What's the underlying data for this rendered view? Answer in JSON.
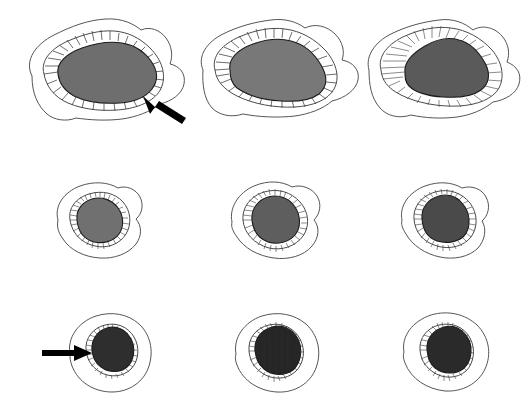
{
  "figure": {
    "title": "Oocyte and follicle development series",
    "background_color": "#ffffff",
    "width": 523,
    "height": 408,
    "rows": 3,
    "columns": 3,
    "panel_count": 9,
    "has_axis_labels": false,
    "has_text_labels": false,
    "outline_color": "#555555",
    "spoke_color": "#3c3c3c",
    "arrow_color": "#000000"
  },
  "panels": [
    {
      "id": "panel-r1c1",
      "row": 1,
      "column": 1,
      "position": {
        "x": 10,
        "y": 8
      },
      "shape": "large-elongated-oval",
      "core_fill": "#6e6e6e",
      "core_label": "oocyte-cytoplasm",
      "envelope_label": "zona-radiata",
      "outline_label": "follicle-wall",
      "spoke_count": 30,
      "has_arrow": true,
      "arrow_direction": "up-left",
      "arrow_target": "follicle-wall-posterior"
    },
    {
      "id": "panel-r1c2",
      "row": 1,
      "column": 2,
      "position": {
        "x": 185,
        "y": 8
      },
      "shape": "large-teardrop-oval",
      "core_fill": "#787878",
      "core_label": "oocyte-cytoplasm",
      "envelope_label": "zona-radiata",
      "outline_label": "follicle-wall",
      "spoke_count": 28,
      "has_arrow": false,
      "arrow_direction": null,
      "arrow_target": null
    },
    {
      "id": "panel-r1c3",
      "row": 1,
      "column": 3,
      "position": {
        "x": 355,
        "y": 8
      },
      "shape": "large-rounded-trapezoid",
      "core_fill": "#5a5a5a",
      "core_label": "oocyte-cytoplasm",
      "envelope_label": "zona-radiata",
      "outline_label": "follicle-wall",
      "spoke_count": 34,
      "has_arrow": false,
      "arrow_direction": null,
      "arrow_target": null
    },
    {
      "id": "panel-r2c1",
      "row": 2,
      "column": 1,
      "position": {
        "x": 46,
        "y": 176
      },
      "shape": "small-round",
      "core_fill": "#707070",
      "core_label": "oocyte-cytoplasm",
      "envelope_label": "zona-radiata",
      "outline_label": "follicle-wall",
      "spoke_count": 40,
      "has_arrow": false,
      "arrow_direction": null,
      "arrow_target": null
    },
    {
      "id": "panel-r2c2",
      "row": 2,
      "column": 2,
      "position": {
        "x": 222,
        "y": 176
      },
      "shape": "small-round",
      "core_fill": "#5e5e5e",
      "core_label": "oocyte-cytoplasm",
      "envelope_label": "zona-radiata",
      "outline_label": "follicle-wall",
      "spoke_count": 42,
      "has_arrow": false,
      "arrow_direction": null,
      "arrow_target": null
    },
    {
      "id": "panel-r2c3",
      "row": 2,
      "column": 3,
      "position": {
        "x": 392,
        "y": 176
      },
      "shape": "small-round",
      "core_fill": "#4a4a4a",
      "core_label": "oocyte-cytoplasm",
      "envelope_label": "zona-radiata",
      "outline_label": "follicle-wall",
      "spoke_count": 44,
      "has_arrow": false,
      "arrow_direction": null,
      "arrow_target": null
    },
    {
      "id": "panel-r3c1",
      "row": 3,
      "column": 1,
      "position": {
        "x": 36,
        "y": 306
      },
      "shape": "small-round-dark",
      "core_fill": "#2e2e2e",
      "core_label": "oocyte-cytoplasm",
      "envelope_label": "zona-radiata",
      "outline_label": "follicle-wall",
      "spoke_count": 30,
      "has_arrow": true,
      "arrow_direction": "right",
      "arrow_target": "oocyte-left-margin"
    },
    {
      "id": "panel-r3c2",
      "row": 3,
      "column": 2,
      "position": {
        "x": 222,
        "y": 306
      },
      "shape": "small-round-dark",
      "core_fill": "#262626",
      "core_label": "oocyte-cytoplasm",
      "envelope_label": "zona-radiata",
      "outline_label": "follicle-wall",
      "spoke_count": 40,
      "has_arrow": false,
      "arrow_direction": null,
      "arrow_target": null
    },
    {
      "id": "panel-r3c3",
      "row": 3,
      "column": 3,
      "position": {
        "x": 392,
        "y": 306
      },
      "shape": "small-round-dark",
      "core_fill": "#2a2a2a",
      "core_label": "oocyte-cytoplasm",
      "envelope_label": "zona-radiata",
      "outline_label": "follicle-wall",
      "spoke_count": 38,
      "has_arrow": false,
      "arrow_direction": null,
      "arrow_target": null
    }
  ]
}
